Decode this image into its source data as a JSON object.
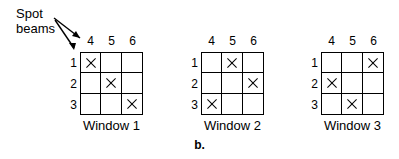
{
  "figure": {
    "caption": "b.",
    "callout": {
      "label_line1": "Spot",
      "label_line2": "beams",
      "arrow_icon": "arrow-pointer-icon"
    }
  },
  "chart_data": {
    "type": "table",
    "subtitle": "b.",
    "xlabel": "",
    "ylabel": "",
    "grid": true,
    "legend_position": "none",
    "column_headers": [
      "4",
      "5",
      "6"
    ],
    "row_headers": [
      "1",
      "2",
      "3"
    ],
    "mark_symbol": "×",
    "windows": [
      {
        "name": "Window 1",
        "cells": [
          [
            true,
            false,
            false
          ],
          [
            false,
            true,
            false
          ],
          [
            false,
            false,
            true
          ]
        ],
        "marked_pairs": [
          {
            "row": "1",
            "column": "4"
          },
          {
            "row": "2",
            "column": "5"
          },
          {
            "row": "3",
            "column": "6"
          }
        ]
      },
      {
        "name": "Window 2",
        "cells": [
          [
            false,
            true,
            false
          ],
          [
            false,
            false,
            true
          ],
          [
            true,
            false,
            false
          ]
        ],
        "marked_pairs": [
          {
            "row": "1",
            "column": "5"
          },
          {
            "row": "2",
            "column": "6"
          },
          {
            "row": "3",
            "column": "4"
          }
        ]
      },
      {
        "name": "Window 3",
        "cells": [
          [
            false,
            false,
            true
          ],
          [
            true,
            false,
            false
          ],
          [
            false,
            true,
            false
          ]
        ],
        "marked_pairs": [
          {
            "row": "1",
            "column": "6"
          },
          {
            "row": "2",
            "column": "4"
          },
          {
            "row": "3",
            "column": "5"
          }
        ]
      }
    ]
  },
  "colors": {
    "ink": "#000000",
    "background": "#ffffff"
  }
}
